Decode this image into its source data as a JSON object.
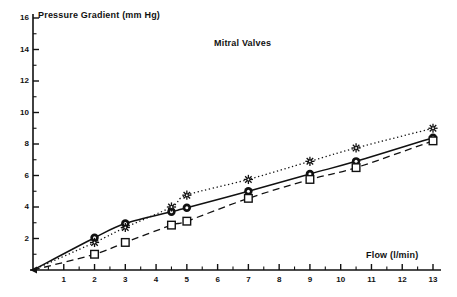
{
  "chart_data": {
    "type": "line",
    "title": "Mitral Valves",
    "xlabel": "Flow (l/min)",
    "ylabel": "Pressure Gradient (mm Hg)",
    "xlim": [
      0,
      13
    ],
    "ylim": [
      0,
      16
    ],
    "grid": false,
    "legend": "none",
    "x_major_ticks": [
      1,
      2,
      3,
      4,
      5,
      6,
      7,
      8,
      9,
      10,
      11,
      12,
      13
    ],
    "x_tick_labels": [
      "1",
      "2",
      "3",
      "4",
      "5",
      "6",
      "7",
      "8",
      "9",
      "10",
      "11",
      "12",
      "13"
    ],
    "y_major_ticks": [
      2,
      4,
      6,
      8,
      10,
      12,
      14,
      16
    ],
    "y_tick_labels": [
      "2",
      "4",
      "6",
      "8",
      "10",
      "12",
      "14",
      "16"
    ],
    "y_minor_ticks": [
      1,
      3,
      5,
      7,
      9,
      11,
      13,
      15
    ],
    "series": [
      {
        "name": "circle-series",
        "marker": "filled-circle",
        "line": "solid",
        "x": [
          0,
          2,
          3,
          4.5,
          5,
          7,
          9,
          10.5,
          13
        ],
        "y": [
          0,
          2.05,
          2.95,
          3.7,
          3.95,
          5.0,
          6.1,
          6.9,
          8.4
        ]
      },
      {
        "name": "star-series",
        "marker": "star",
        "line": "dotted",
        "x": [
          0,
          2,
          3,
          4.5,
          5,
          7,
          9,
          10.5,
          13
        ],
        "y": [
          0,
          1.75,
          2.7,
          4.0,
          4.75,
          5.75,
          6.9,
          7.75,
          9.0
        ]
      },
      {
        "name": "square-series",
        "marker": "open-square",
        "line": "dashed",
        "x": [
          0,
          2,
          3,
          4.5,
          5,
          7,
          9,
          10.5,
          13
        ],
        "y": [
          0,
          1.0,
          1.75,
          2.85,
          3.1,
          4.55,
          5.75,
          6.5,
          8.2
        ]
      }
    ]
  },
  "axes": {
    "title": "Mitral Valves",
    "ylabel": "Pressure Gradient (mm Hg)",
    "xlabel": "Flow (l/min)"
  }
}
